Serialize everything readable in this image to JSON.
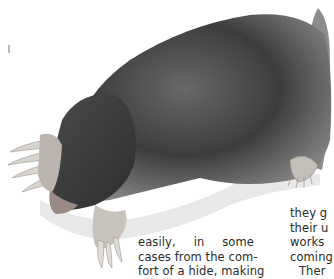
{
  "illustration": {
    "subject": "mole",
    "description": "Pencil illustration of a mole lying on soil"
  },
  "text_columns": {
    "left": {
      "lines": [
        "easily, in some",
        "cases from the com-",
        "fort of a hide, making"
      ]
    },
    "right": {
      "lines": [
        "they g",
        "their u",
        "works",
        "coming",
        "Ther"
      ]
    }
  }
}
